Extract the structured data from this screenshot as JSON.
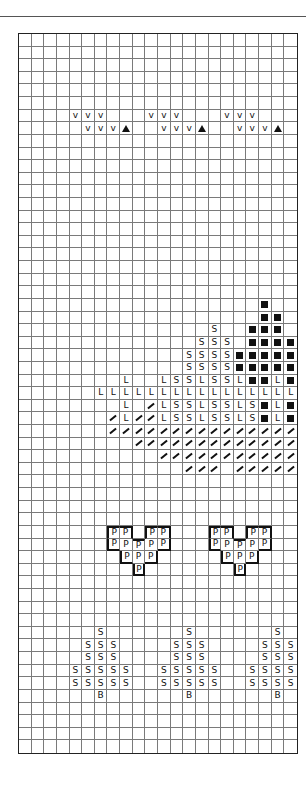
{
  "chart": {
    "columns": 22,
    "rows": 57,
    "colors": {
      "ink": "#111111",
      "grid": "#7a7a7a",
      "background": "#ffffff"
    },
    "symbol_key": {
      "V": "v-mark",
      "▲": "filled-triangle",
      "■": "filled-square",
      "S": "letter-s",
      "L": "letter-l",
      "/": "slash",
      "P": "letter-p",
      "B": "letter-b"
    },
    "marks": [
      {
        "row": 6,
        "cells": {
          "4": "V",
          "5": "V",
          "6": "V",
          "10": "V",
          "11": "V",
          "12": "V",
          "16": "V",
          "17": "V",
          "18": "V"
        }
      },
      {
        "row": 7,
        "cells": {
          "5": "V",
          "6": "V",
          "7": "V",
          "8": "▲",
          "11": "V",
          "12": "V",
          "13": "V",
          "14": "▲",
          "17": "V",
          "18": "V",
          "19": "V",
          "20": "▲"
        }
      },
      {
        "row": 21,
        "cells": {
          "19": "■"
        }
      },
      {
        "row": 22,
        "cells": {
          "19": "■",
          "20": "■"
        }
      },
      {
        "row": 23,
        "cells": {
          "15": "S",
          "18": "■",
          "19": "■",
          "20": "■"
        }
      },
      {
        "row": 24,
        "cells": {
          "14": "S",
          "15": "S",
          "16": "S",
          "18": "■",
          "19": "■",
          "20": "■",
          "21": "■"
        }
      },
      {
        "row": 25,
        "cells": {
          "13": "S",
          "14": "S",
          "15": "S",
          "16": "S",
          "17": "■",
          "18": "■",
          "19": "■",
          "20": "■",
          "21": "■"
        }
      },
      {
        "row": 26,
        "cells": {
          "13": "S",
          "14": "S",
          "15": "S",
          "16": "S",
          "17": "■",
          "18": "■",
          "19": "■",
          "20": "■",
          "21": "■"
        }
      },
      {
        "row": 27,
        "cells": {
          "8": "L",
          "11": "L",
          "12": "S",
          "13": "S",
          "14": "L",
          "15": "S",
          "16": "S",
          "17": "L",
          "18": "■",
          "19": "■",
          "20": "L",
          "21": "■"
        }
      },
      {
        "row": 28,
        "cells": {
          "6": "L",
          "7": "L",
          "8": "L",
          "9": "L",
          "10": "L",
          "11": "L",
          "12": "L",
          "13": "L",
          "14": "L",
          "15": "L",
          "16": "L",
          "17": "L",
          "18": "L",
          "19": "L",
          "20": "L",
          "21": "L"
        }
      },
      {
        "row": 29,
        "cells": {
          "8": "L",
          "10": "/",
          "11": "L",
          "12": "S",
          "13": "S",
          "14": "L",
          "15": "S",
          "16": "S",
          "17": "L",
          "18": "S",
          "19": "■",
          "20": "L",
          "21": "■"
        }
      },
      {
        "row": 30,
        "cells": {
          "7": "/",
          "8": "L",
          "9": "/",
          "10": "/",
          "11": "L",
          "12": "S",
          "13": "S",
          "14": "L",
          "15": "S",
          "16": "S",
          "17": "L",
          "18": "S",
          "19": "■",
          "20": "L",
          "21": "■"
        }
      },
      {
        "row": 31,
        "cells": {
          "7": "/",
          "8": "/",
          "9": "/",
          "10": "/",
          "11": "/",
          "12": "/",
          "13": "/",
          "14": "/",
          "15": "/",
          "16": "/",
          "17": "/",
          "18": "/",
          "19": "/",
          "20": "/",
          "21": "/"
        }
      },
      {
        "row": 32,
        "cells": {
          "9": "/",
          "10": "/",
          "11": "/",
          "12": "/",
          "13": "/",
          "14": "/",
          "15": "/",
          "16": "/",
          "17": "/",
          "18": "/",
          "19": "/",
          "20": "/",
          "21": "/"
        }
      },
      {
        "row": 33,
        "cells": {
          "11": "/",
          "12": "/",
          "13": "/",
          "14": "/",
          "15": "/",
          "16": "/",
          "17": "/",
          "18": "/",
          "19": "/",
          "20": "/",
          "21": "/"
        }
      },
      {
        "row": 34,
        "cells": {
          "13": "/",
          "14": "/",
          "15": "/",
          "17": "/",
          "18": "/",
          "19": "/",
          "20": "/",
          "21": "/"
        }
      },
      {
        "row": 39,
        "cells": {
          "7": "P",
          "8": "P",
          "10": "P",
          "11": "P",
          "15": "P",
          "16": "P",
          "18": "P",
          "19": "P"
        }
      },
      {
        "row": 40,
        "cells": {
          "7": "P",
          "8": "P",
          "9": "P",
          "10": "P",
          "11": "P",
          "15": "P",
          "16": "P",
          "17": "P",
          "18": "P",
          "19": "P"
        }
      },
      {
        "row": 41,
        "cells": {
          "8": "P",
          "9": "P",
          "10": "P",
          "16": "P",
          "17": "P",
          "18": "P"
        }
      },
      {
        "row": 42,
        "cells": {
          "9": "P",
          "17": "P"
        }
      },
      {
        "row": 47,
        "cells": {
          "6": "S",
          "13": "S",
          "20": "S"
        }
      },
      {
        "row": 48,
        "cells": {
          "5": "S",
          "6": "S",
          "7": "S",
          "12": "S",
          "13": "S",
          "14": "S",
          "19": "S",
          "20": "S",
          "21": "S"
        }
      },
      {
        "row": 49,
        "cells": {
          "5": "S",
          "6": "S",
          "7": "S",
          "12": "S",
          "13": "S",
          "14": "S",
          "19": "S",
          "20": "S",
          "21": "S"
        }
      },
      {
        "row": 50,
        "cells": {
          "4": "S",
          "5": "S",
          "6": "S",
          "7": "S",
          "8": "S",
          "11": "S",
          "12": "S",
          "13": "S",
          "14": "S",
          "15": "S",
          "18": "S",
          "19": "S",
          "20": "S",
          "21": "S"
        }
      },
      {
        "row": 51,
        "cells": {
          "4": "S",
          "5": "S",
          "6": "S",
          "7": "S",
          "8": "S",
          "11": "S",
          "12": "S",
          "13": "S",
          "14": "S",
          "15": "S",
          "18": "S",
          "19": "S",
          "20": "S",
          "21": "S"
        }
      },
      {
        "row": 52,
        "cells": {
          "6": "B",
          "13": "B",
          "20": "B"
        }
      }
    ],
    "outlined_shapes": [
      {
        "name": "p-heart-left",
        "cells": [
          [
            39,
            7
          ],
          [
            39,
            8
          ],
          [
            39,
            10
          ],
          [
            39,
            11
          ],
          [
            40,
            7
          ],
          [
            40,
            8
          ],
          [
            40,
            9
          ],
          [
            40,
            10
          ],
          [
            40,
            11
          ],
          [
            41,
            8
          ],
          [
            41,
            9
          ],
          [
            41,
            10
          ],
          [
            42,
            9
          ]
        ]
      },
      {
        "name": "p-heart-right",
        "cells": [
          [
            39,
            15
          ],
          [
            39,
            16
          ],
          [
            39,
            18
          ],
          [
            39,
            19
          ],
          [
            40,
            15
          ],
          [
            40,
            16
          ],
          [
            40,
            17
          ],
          [
            40,
            18
          ],
          [
            40,
            19
          ],
          [
            41,
            16
          ],
          [
            41,
            17
          ],
          [
            41,
            18
          ],
          [
            42,
            17
          ]
        ]
      }
    ]
  }
}
